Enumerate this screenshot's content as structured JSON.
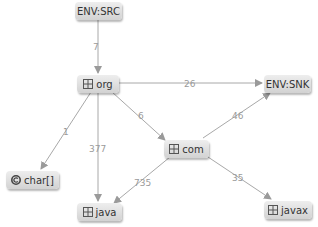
{
  "diagram": {
    "type": "dependency-graph",
    "nodes": [
      {
        "id": "env_src",
        "label": "ENV:SRC",
        "icon": "none"
      },
      {
        "id": "org",
        "label": "org",
        "icon": "package-icon"
      },
      {
        "id": "env_snk",
        "label": "ENV:SNK",
        "icon": "none"
      },
      {
        "id": "com",
        "label": "com",
        "icon": "package-icon"
      },
      {
        "id": "char",
        "label": "char[]",
        "icon": "class-icon"
      },
      {
        "id": "java",
        "label": "java",
        "icon": "package-icon"
      },
      {
        "id": "javax",
        "label": "javax",
        "icon": "package-icon"
      }
    ],
    "edges": [
      {
        "from": "env_src",
        "to": "org",
        "label": "7"
      },
      {
        "from": "org",
        "to": "env_snk",
        "label": "26"
      },
      {
        "from": "com",
        "to": "env_snk",
        "label": "46"
      },
      {
        "from": "org",
        "to": "com",
        "label": "6"
      },
      {
        "from": "org",
        "to": "char",
        "label": "1"
      },
      {
        "from": "org",
        "to": "java",
        "label": "377"
      },
      {
        "from": "com",
        "to": "java",
        "label": "735"
      },
      {
        "from": "com",
        "to": "javax",
        "label": "35"
      }
    ],
    "colors": {
      "edge": "#a8a8a8",
      "edge_label": "#9a9a9a",
      "node_top": "#eeeeee",
      "node_bottom": "#d2d2d2",
      "node_text": "#333333"
    }
  }
}
